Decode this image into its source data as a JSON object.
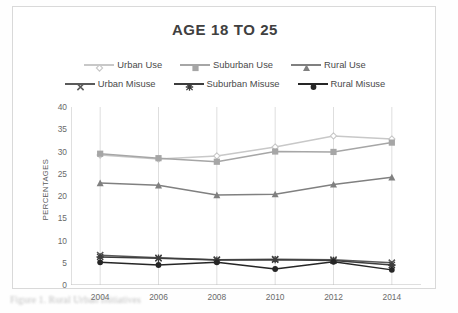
{
  "figure": {
    "caption_text": "Figure 1. Rural Urban Initiatives"
  },
  "chart_data": {
    "type": "line",
    "title": "AGE 18 TO 25",
    "xlabel": "",
    "ylabel": "PERCENTAGES",
    "x": [
      2004,
      2006,
      2008,
      2010,
      2012,
      2014
    ],
    "categories": [
      "2004",
      "2006",
      "2008",
      "2010",
      "2012",
      "2014"
    ],
    "ylim": [
      0,
      40
    ],
    "ytick_step": 5,
    "yticks": [
      "40",
      "35",
      "30",
      "25",
      "20",
      "15",
      "10",
      "5",
      "0"
    ],
    "grid": "vertical-only",
    "legend_position": "top",
    "series": [
      {
        "name": "Urban Use",
        "marker": "diamond",
        "color": "#c8c8c8",
        "values": [
          29.2,
          28.3,
          29.0,
          31.0,
          33.5,
          32.8
        ]
      },
      {
        "name": "Suburban Use",
        "marker": "square",
        "color": "#a6a6a6",
        "values": [
          29.5,
          28.5,
          27.7,
          30.0,
          29.9,
          32.0
        ]
      },
      {
        "name": "Rural Use",
        "marker": "triangle",
        "color": "#808080",
        "values": [
          22.9,
          22.4,
          20.2,
          20.4,
          22.6,
          24.2
        ]
      },
      {
        "name": "Urban Misuse",
        "marker": "x",
        "color": "#5a5a5a",
        "values": [
          6.7,
          6.1,
          5.7,
          5.8,
          5.7,
          5.0
        ]
      },
      {
        "name": "Suburban Misuse",
        "marker": "asterisk",
        "color": "#3d3d3d",
        "values": [
          6.3,
          6.0,
          5.6,
          5.7,
          5.5,
          4.5
        ]
      },
      {
        "name": "Rural Misuse",
        "marker": "circle",
        "color": "#262626",
        "values": [
          5.1,
          4.5,
          5.1,
          3.6,
          5.2,
          3.4
        ]
      }
    ]
  },
  "colors": {
    "frame_border": "#d9d9d9",
    "gridline": "#d6d6d6",
    "axis": "#bfbfbf",
    "title_text": "#404040",
    "tick_text": "#6a6a6a"
  }
}
